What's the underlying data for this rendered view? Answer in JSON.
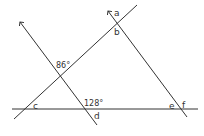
{
  "diagram": {
    "type": "geometry-angles",
    "colors": {
      "line": "#333333",
      "text": "#333333",
      "background": "#ffffff"
    },
    "lines": [
      {
        "id": "horizontal",
        "x1": 12,
        "y1": 109,
        "x2": 198,
        "y2": 109,
        "arrow": false
      },
      {
        "id": "diagonal-up-right",
        "x1": 14,
        "y1": 119,
        "x2": 137,
        "y2": 5,
        "arrow": false
      },
      {
        "id": "left-transversal",
        "x1": 97,
        "y1": 125,
        "x2": 20,
        "y2": 22,
        "arrow": true
      },
      {
        "id": "right-transversal",
        "x1": 187,
        "y1": 117,
        "x2": 108,
        "y2": 11,
        "arrow": true
      }
    ],
    "labels": {
      "a": "a",
      "b": "b",
      "c": "c",
      "d": "d",
      "e": "e",
      "f": "f",
      "angle_86": "86°",
      "angle_128": "128°"
    }
  }
}
